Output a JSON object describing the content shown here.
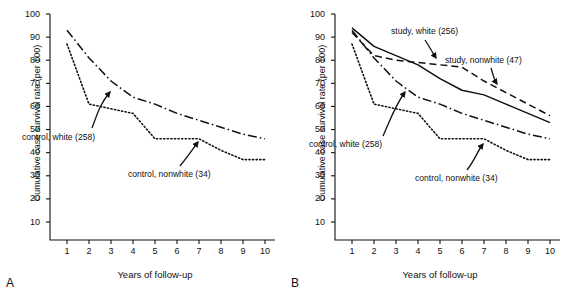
{
  "figure": {
    "panels": [
      {
        "letter": "A",
        "xlabel": "Years of follow-up",
        "ylabel": "Cumulative case survival rate (per 100)"
      },
      {
        "letter": "B",
        "xlabel": "Years of follow-up",
        "ylabel": "Cumulative case survival rate (per 100)"
      }
    ]
  },
  "axes": {
    "x_ticks": [
      "1",
      "2",
      "3",
      "4",
      "5",
      "6",
      "7",
      "8",
      "9",
      "10"
    ],
    "y_ticks": [
      "100",
      "90",
      "80",
      "70",
      "60",
      "50",
      "40",
      "30",
      "20",
      "10"
    ]
  },
  "annotations": {
    "control_white": "control, white (258)",
    "control_nonwhite": "control, nonwhite (34)",
    "study_white": "study, white (256)",
    "study_nonwhite": "study, nonwhite (47)"
  },
  "chart_data": [
    {
      "type": "line",
      "panel": "A",
      "title": "",
      "xlabel": "Years of follow-up",
      "ylabel": "Cumulative case survival rate (per 100)",
      "xlim": [
        1,
        10
      ],
      "ylim": [
        10,
        100
      ],
      "grid": false,
      "legend": "inline-annotations",
      "x": [
        1,
        2,
        3,
        4,
        5,
        6,
        7,
        8,
        9,
        10
      ],
      "series": [
        {
          "name": "control, white (258)",
          "n": 258,
          "linestyle": "dotted",
          "color": "#111111",
          "values": [
            87,
            61,
            59,
            57,
            46,
            46,
            46,
            41,
            37,
            37
          ]
        },
        {
          "name": "control, nonwhite (34)",
          "n": 34,
          "linestyle": "dashdot",
          "color": "#111111",
          "values": [
            93,
            81,
            71,
            64,
            61,
            57,
            54,
            51,
            48,
            46
          ]
        }
      ]
    },
    {
      "type": "line",
      "panel": "B",
      "title": "",
      "xlabel": "Years of follow-up",
      "ylabel": "Cumulative case survival rate (per 100)",
      "xlim": [
        1,
        10
      ],
      "ylim": [
        10,
        100
      ],
      "grid": false,
      "legend": "inline-annotations",
      "x": [
        1,
        2,
        3,
        4,
        5,
        6,
        7,
        8,
        9,
        10
      ],
      "series": [
        {
          "name": "study, white (256)",
          "n": 256,
          "linestyle": "solid",
          "color": "#111111",
          "values": [
            94,
            86,
            82,
            78,
            72,
            67,
            65,
            61,
            57,
            53
          ]
        },
        {
          "name": "study, nonwhite (47)",
          "n": 47,
          "linestyle": "dashed",
          "color": "#111111",
          "values": [
            92,
            82,
            80,
            79,
            78,
            77,
            71,
            66,
            61,
            56
          ]
        },
        {
          "name": "control, white (258)",
          "n": 258,
          "linestyle": "dotted",
          "color": "#111111",
          "values": [
            87,
            61,
            59,
            57,
            46,
            46,
            46,
            41,
            37,
            37
          ]
        },
        {
          "name": "control, nonwhite (34)",
          "n": 34,
          "linestyle": "dashdot",
          "color": "#111111",
          "values": [
            93,
            81,
            71,
            64,
            61,
            57,
            54,
            51,
            48,
            46
          ]
        }
      ]
    }
  ]
}
